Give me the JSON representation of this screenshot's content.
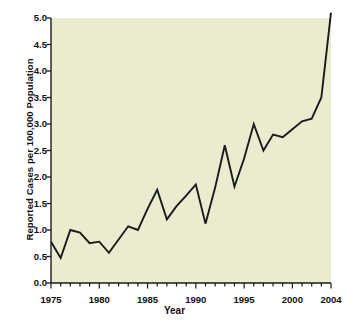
{
  "chart_data": {
    "type": "line",
    "title": "",
    "xlabel": "Year",
    "ylabel": "Reported Cases per 100,000 Population",
    "xlim": [
      1975,
      2004
    ],
    "ylim": [
      0.0,
      5.0
    ],
    "grid": false,
    "legend": null,
    "line_color": "#1a1a1a",
    "plot_background": "#ebeccf",
    "x": [
      1975,
      1976,
      1977,
      1978,
      1979,
      1980,
      1981,
      1982,
      1983,
      1984,
      1985,
      1986,
      1987,
      1988,
      1989,
      1990,
      1991,
      1992,
      1993,
      1994,
      1995,
      1996,
      1997,
      1998,
      1999,
      2000,
      2001,
      2002,
      2003,
      2004
    ],
    "values": [
      0.78,
      0.47,
      1.0,
      0.95,
      0.75,
      0.78,
      0.57,
      0.82,
      1.07,
      1.0,
      1.4,
      1.76,
      1.2,
      1.45,
      1.65,
      1.86,
      1.12,
      1.8,
      2.6,
      1.82,
      2.35,
      3.0,
      2.5,
      2.8,
      2.75,
      2.9,
      3.05,
      3.1,
      3.5,
      5.1
    ],
    "ytick_labels": [
      "0.0",
      "0.5",
      "1.0",
      "1.5",
      "2.0",
      "2.5",
      "3.0",
      "3.5",
      "4.0",
      "4.5",
      "5.0"
    ],
    "ytick_values": [
      0.0,
      0.5,
      1.0,
      1.5,
      2.0,
      2.5,
      3.0,
      3.5,
      4.0,
      4.5,
      5.0
    ],
    "xtick_labels": [
      "1975",
      "1980",
      "1985",
      "1990",
      "1995",
      "2000",
      "2004"
    ],
    "xtick_values": [
      1975,
      1980,
      1985,
      1990,
      1995,
      2000,
      2004
    ],
    "xminor_step": 1
  }
}
